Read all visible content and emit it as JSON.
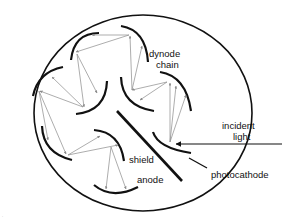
{
  "diagram": {
    "labels": {
      "dynode_chain_line1": "dynode",
      "dynode_chain_line2": "chain",
      "incident_light_line1": "incident",
      "incident_light_line2": "light",
      "shield": "shield",
      "anode": "anode",
      "photocathode": "photocathode"
    },
    "colors": {
      "structure": "#111111",
      "electron_paths": "#8a8a8a",
      "background": "#ffffff"
    },
    "components": [
      "outer envelope",
      "photocathode",
      "dynode chain (8 dynodes)",
      "shield",
      "anode",
      "incident light arrow"
    ],
    "corner_mark": "."
  }
}
